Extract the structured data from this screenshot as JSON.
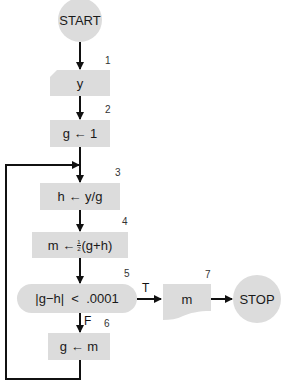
{
  "colors": {
    "shape_fill": "#dcdcdc",
    "line": "#111111",
    "text": "#1a1a1a"
  },
  "flowchart": {
    "start": {
      "label": "START"
    },
    "stop": {
      "label": "STOP"
    },
    "steps": [
      {
        "number": "1",
        "shape": "manual-input",
        "label": "y"
      },
      {
        "number": "2",
        "shape": "process",
        "label": "g ← 1"
      },
      {
        "number": "3",
        "shape": "process",
        "label": "h ← y/g"
      },
      {
        "number": "4",
        "shape": "process",
        "label_prefix": "m ←",
        "frac_num": "1",
        "frac_den": "2",
        "label_suffix": "(g+h)"
      },
      {
        "number": "5",
        "shape": "decision",
        "label": "|g−h|  <  .0001"
      },
      {
        "number": "6",
        "shape": "process",
        "label": "g ← m"
      },
      {
        "number": "7",
        "shape": "output-document",
        "label": "m"
      }
    ],
    "branches": {
      "true_label": "T",
      "false_label": "F"
    }
  }
}
